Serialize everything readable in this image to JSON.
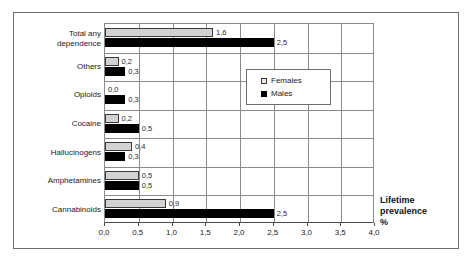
{
  "chart_data": {
    "type": "bar",
    "orientation": "horizontal",
    "title": "",
    "xlabel": "Lifetime prevalence %",
    "ylabel": "",
    "xlim": [
      0.0,
      4.0
    ],
    "xticks": [
      "0,0",
      "0,5",
      "1,0",
      "1,5",
      "2,0",
      "2,5",
      "3,0",
      "3,5",
      "4,0"
    ],
    "xtick_values": [
      0.0,
      0.5,
      1.0,
      1.5,
      2.0,
      2.5,
      3.0,
      3.5,
      4.0
    ],
    "grid": true,
    "legend_position": "upper-right-inside",
    "categories": [
      "Total any dependence",
      "Others",
      "Opioids",
      "Cocaine",
      "Hallucinogens",
      "Amphetamines",
      "Cannabinoids"
    ],
    "series": [
      {
        "name": "Females",
        "color": "#d2d2d2",
        "values": [
          1.6,
          0.2,
          0.0,
          0.2,
          0.4,
          0.5,
          0.9
        ],
        "labels": [
          "1,6",
          "0,2",
          "0,0",
          "0,2",
          "0,4",
          "0,5",
          "0,9"
        ]
      },
      {
        "name": "Males",
        "color": "#000000",
        "values": [
          2.5,
          0.3,
          0.3,
          0.5,
          0.3,
          0.5,
          2.5
        ],
        "labels": [
          "2,5",
          "0,3",
          "0,3",
          "0,5",
          "0,3",
          "0,5",
          "2,5"
        ]
      }
    ]
  },
  "legend": {
    "items": [
      {
        "label": "Females"
      },
      {
        "label": "Males"
      }
    ]
  },
  "axis_title": {
    "line1": "Lifetime",
    "line2": "prevalence",
    "line3": "%"
  },
  "category_labels": [
    {
      "line1": "Total any",
      "line2": "dependence"
    },
    {
      "line1": "Others",
      "line2": ""
    },
    {
      "line1": "Opioids",
      "line2": ""
    },
    {
      "line1": "Cocaine",
      "line2": ""
    },
    {
      "line1": "Hallucinogens",
      "line2": ""
    },
    {
      "line1": "Amphetamines",
      "line2": ""
    },
    {
      "line1": "Cannabinoids",
      "line2": ""
    }
  ]
}
